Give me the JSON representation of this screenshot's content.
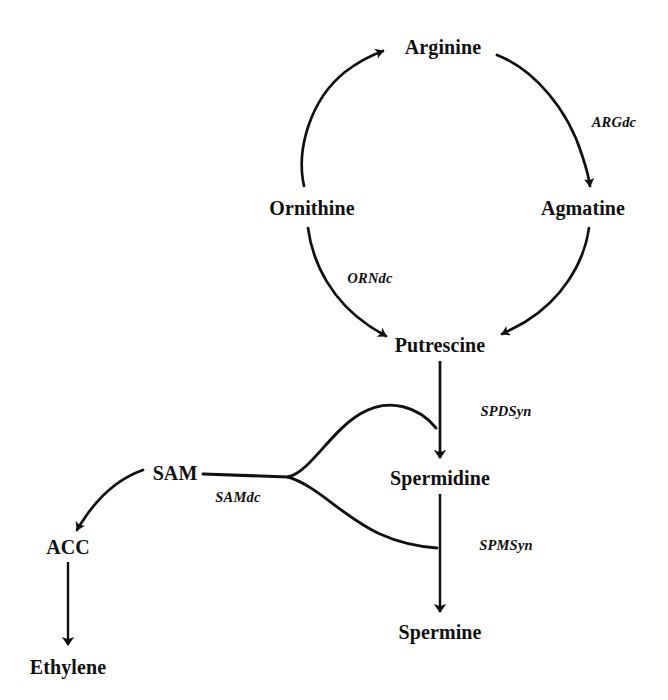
{
  "diagram": {
    "type": "pathway-diagram",
    "background_color": "#ffffff",
    "ink_color": "#101010",
    "nodes": [
      {
        "id": "arginine",
        "label": "Arginine",
        "x": 443,
        "y": 47
      },
      {
        "id": "ornithine",
        "label": "Ornithine",
        "x": 312,
        "y": 208
      },
      {
        "id": "agmatine",
        "label": "Agmatine",
        "x": 583,
        "y": 208
      },
      {
        "id": "putrescine",
        "label": "Putrescine",
        "x": 440,
        "y": 345
      },
      {
        "id": "sam",
        "label": "SAM",
        "x": 175,
        "y": 473
      },
      {
        "id": "spermidine",
        "label": "Spermidine",
        "x": 440,
        "y": 478
      },
      {
        "id": "acc",
        "label": "ACC",
        "x": 68,
        "y": 547
      },
      {
        "id": "spermine",
        "label": "Spermine",
        "x": 440,
        "y": 632
      },
      {
        "id": "ethylene",
        "label": "Ethylene",
        "x": 68,
        "y": 667
      }
    ],
    "enzymes": [
      {
        "id": "argdc",
        "label": "ARGdc",
        "x": 614,
        "y": 122
      },
      {
        "id": "orndc",
        "label": "ORNdc",
        "x": 370,
        "y": 278
      },
      {
        "id": "spdsyn",
        "label": "SPDSyn",
        "x": 506,
        "y": 411
      },
      {
        "id": "samdc",
        "label": "SAMdc",
        "x": 238,
        "y": 497
      },
      {
        "id": "spmsyn",
        "label": "SPMSyn",
        "x": 506,
        "y": 545
      }
    ],
    "edges": [
      {
        "id": "ornithine-to-arginine",
        "from": "ornithine",
        "to": "arginine",
        "style": "curved",
        "arrowhead": true
      },
      {
        "id": "arginine-to-agmatine",
        "from": "arginine",
        "to": "agmatine",
        "style": "curved",
        "arrowhead": true,
        "enzyme": "argdc"
      },
      {
        "id": "agmatine-to-putrescine",
        "from": "agmatine",
        "to": "putrescine",
        "style": "curved",
        "arrowhead": true
      },
      {
        "id": "ornithine-to-putrescine",
        "from": "ornithine",
        "to": "putrescine",
        "style": "curved",
        "arrowhead": true,
        "enzyme": "orndc"
      },
      {
        "id": "putrescine-to-spermidine",
        "from": "putrescine",
        "to": "spermidine",
        "style": "straight",
        "arrowhead": true,
        "enzyme": "spdsyn"
      },
      {
        "id": "spermidine-to-spermine",
        "from": "spermidine",
        "to": "spermine",
        "style": "straight",
        "arrowhead": true,
        "enzyme": "spmsyn"
      },
      {
        "id": "sam-to-spermidine",
        "from": "sam",
        "to": "spermidine",
        "style": "curved-branch",
        "arrowhead": false,
        "enzyme": "samdc"
      },
      {
        "id": "sam-to-spermine",
        "from": "sam",
        "to": "spermine",
        "style": "curved-branch",
        "arrowhead": false,
        "enzyme": "samdc"
      },
      {
        "id": "sam-to-acc",
        "from": "sam",
        "to": "acc",
        "style": "curved",
        "arrowhead": true
      },
      {
        "id": "acc-to-ethylene",
        "from": "acc",
        "to": "ethylene",
        "style": "straight",
        "arrowhead": true
      }
    ]
  }
}
